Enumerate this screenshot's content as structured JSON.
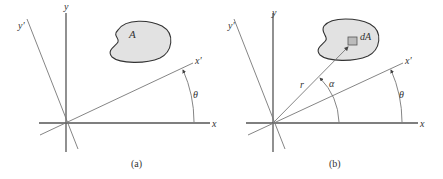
{
  "figure": {
    "panels": [
      {
        "caption": "(a)",
        "labels": {
          "x": "x",
          "y": "y",
          "x_prime": "x′",
          "y_prime": "y′",
          "angle": "θ",
          "area": "A"
        }
      },
      {
        "caption": "(b)",
        "labels": {
          "x": "x",
          "y": "y",
          "x_prime": "x′",
          "y_prime": "y′",
          "angle_theta": "θ",
          "angle_alpha": "α",
          "radius": "r",
          "element": "dA"
        }
      }
    ],
    "colors": {
      "axis": "#555555",
      "fill": "#e2e2e2",
      "outline": "#333333"
    }
  }
}
